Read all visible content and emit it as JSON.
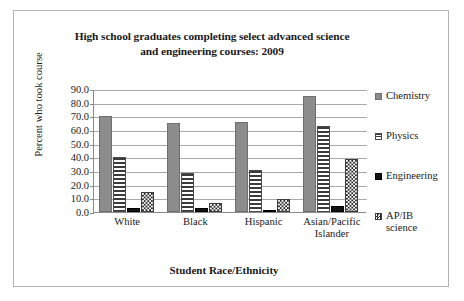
{
  "figure": {
    "title_line1": "High school graduates completing select advanced science",
    "title_line2": "and engineering courses: 2009",
    "frame_color": "#b4b4b4",
    "background": "#ffffff"
  },
  "chart_data": {
    "type": "bar",
    "title": "High school graduates completing select advanced science and engineering courses: 2009",
    "xlabel": "Student Race/Ethnicity",
    "ylabel": "Percent who took course",
    "ylim": [
      0,
      90
    ],
    "ytick_labels": [
      "90.0",
      "80.0",
      "70.0",
      "60.0",
      "50.0",
      "40.0",
      "30.0",
      "20.0",
      "10.0",
      "0.0"
    ],
    "ytick_values": [
      90,
      80,
      70,
      60,
      50,
      40,
      30,
      20,
      10,
      0
    ],
    "grid": true,
    "legend_position": "right",
    "categories": [
      "White",
      "Black",
      "Hispanic",
      "Asian/Pacific Islander"
    ],
    "category_lines": [
      [
        "White"
      ],
      [
        "Black"
      ],
      [
        "Hispanic"
      ],
      [
        "Asian/Pacific",
        "Islander"
      ]
    ],
    "series": [
      {
        "name": "Chemistry",
        "legend_label": "Chemistry",
        "pattern": "solid-gray",
        "color": "#8c8c8c",
        "values": [
          70.0,
          65.0,
          65.8,
          84.7
        ]
      },
      {
        "name": "Physics",
        "legend_label": "Physics",
        "pattern": "horizontal-stripes",
        "color": "#3c3c3c",
        "values": [
          40.5,
          28.5,
          31.0,
          63.0
        ]
      },
      {
        "name": "Engineering",
        "legend_label": "Engineering",
        "pattern": "solid-black",
        "color": "#131313",
        "values": [
          3.2,
          3.0,
          1.7,
          4.3
        ]
      },
      {
        "name": "AP/IB science",
        "legend_label": "AP/IB\nscience",
        "pattern": "checkerboard",
        "color": "#2e2e2e",
        "values": [
          15.0,
          6.3,
          9.5,
          39.0
        ]
      }
    ]
  }
}
